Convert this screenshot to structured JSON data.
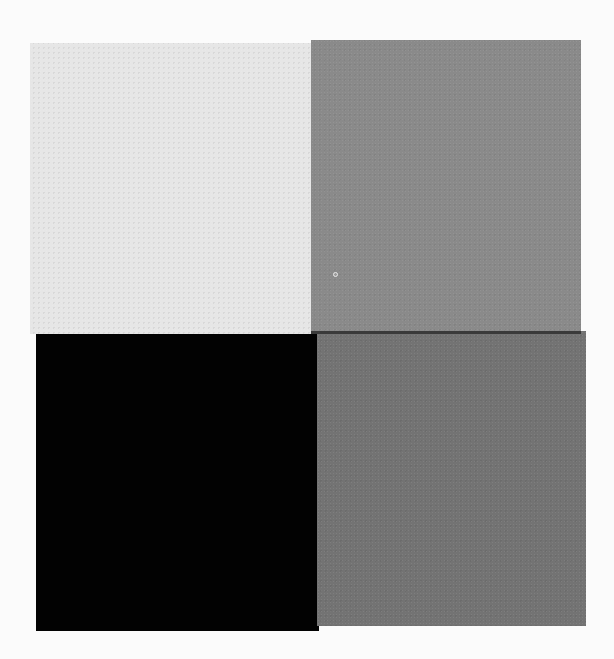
{
  "swatches": [
    {
      "id": "top-left",
      "label": "light gray",
      "color": "#e6e6e6"
    },
    {
      "id": "top-right",
      "label": "medium gray",
      "color": "#8a8a8a"
    },
    {
      "id": "bottom-left",
      "label": "black",
      "color": "#020202"
    },
    {
      "id": "bottom-right",
      "label": "dark gray",
      "color": "#737373"
    }
  ],
  "background": "#fbfbfb"
}
